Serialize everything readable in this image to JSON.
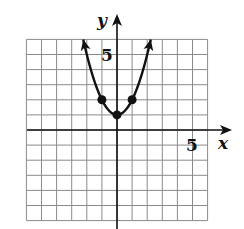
{
  "chart_data": {
    "type": "line",
    "title": "",
    "xlabel": "x",
    "ylabel": "y",
    "xlim": [
      -6,
      6
    ],
    "ylim": [
      -6,
      6
    ],
    "grid": true,
    "grid_step": 1,
    "tick_labels": {
      "x": [
        "5"
      ],
      "y": [
        "5"
      ]
    },
    "function": "y = x^2 + 1",
    "series": [
      {
        "name": "parabola",
        "x": [
          -2.24,
          -2,
          -1.5,
          -1,
          -0.5,
          0,
          0.5,
          1,
          1.5,
          2,
          2.24
        ],
        "y": [
          6,
          5,
          3.25,
          2,
          1.25,
          1,
          1.25,
          2,
          3.25,
          5,
          6
        ],
        "arrows_at_ends": true
      }
    ],
    "points": [
      {
        "x": -1,
        "y": 2
      },
      {
        "x": 0,
        "y": 1
      },
      {
        "x": 1,
        "y": 2
      }
    ]
  },
  "labels": {
    "x_axis": "x",
    "y_axis": "y",
    "x_tick": "5",
    "y_tick": "5"
  },
  "colors": {
    "grid": "#8a8a8a",
    "axis": "#111111",
    "curve": "#111111"
  }
}
